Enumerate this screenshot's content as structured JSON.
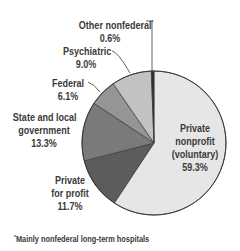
{
  "chart_data": {
    "type": "pie",
    "title": "",
    "start_angle_deg": 0,
    "direction": "clockwise",
    "slices": [
      {
        "label": "Private nonprofit (voluntary)",
        "value": 59.3,
        "display": "59.3%",
        "color": "#e6e6e6"
      },
      {
        "label": "Private for profit",
        "value": 11.7,
        "display": "11.7%",
        "color": "#5c5c5c"
      },
      {
        "label": "State and local government",
        "value": 13.3,
        "display": "13.3%",
        "color": "#7a7a7a"
      },
      {
        "label": "Federal",
        "value": 6.1,
        "display": "6.1%",
        "color": "#959595"
      },
      {
        "label": "Psychiatric",
        "value": 9.0,
        "display": "9.0%",
        "color": "#c2c2c2"
      },
      {
        "label": "Other nonfederal*",
        "value": 0.6,
        "display": "0.6%",
        "color": "#2e2e2e"
      }
    ],
    "footnote": "*Mainly nonfederal long-term hospitals",
    "legend": "none (direct labels)"
  },
  "labels": {
    "other": {
      "line1": "Other nonfederal",
      "mark": "*",
      "value": "0.6%"
    },
    "psychiatric": {
      "line1": "Psychiatric",
      "value": "9.0%"
    },
    "federal": {
      "line1": "Federal",
      "value": "6.1%"
    },
    "state": {
      "line1": "State and local",
      "line2": "government",
      "value": "13.3%"
    },
    "private_profit": {
      "line1": "Private",
      "line2": "for profit",
      "value": "11.7%"
    },
    "private_nonprofit": {
      "line1": "Private",
      "line2": "nonprofit",
      "line3": "(voluntary)",
      "value": "59.3%"
    }
  },
  "footnote": {
    "mark": "*",
    "text": "Mainly nonfederal long-term hospitals"
  }
}
